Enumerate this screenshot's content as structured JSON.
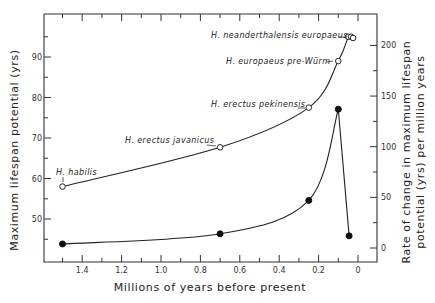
{
  "chart_data": {
    "type": "line",
    "title": "",
    "xlabel": "Millions of years before present",
    "ylabel": "Maximum lifespan potential (yrs)",
    "y2label_line1": "Rate of change in maximum lifespan",
    "y2label_line2": "potential (yrs) per million years",
    "xlim": [
      1.62,
      -0.05
    ],
    "x_reversed": true,
    "ylim": [
      42,
      99
    ],
    "y2lim": [
      -12,
      220
    ],
    "x_ticks": [
      1.4,
      1.2,
      1.0,
      0.8,
      0.6,
      0.4,
      0.2,
      0
    ],
    "x_tick_labels": [
      "1.4",
      "1.2",
      "1.0",
      "0.8",
      "0.6",
      "0.4",
      "0.2",
      "0"
    ],
    "y_ticks": [
      50,
      60,
      70,
      80,
      90
    ],
    "y_tick_labels": [
      "50",
      "60",
      "70",
      "80",
      "90"
    ],
    "y2_ticks": [
      0,
      50,
      100,
      150,
      200
    ],
    "y2_tick_labels": [
      "0",
      "50",
      "100",
      "150",
      "200"
    ],
    "grid": false,
    "series": [
      {
        "name": "Maximum lifespan potential",
        "axis": "left",
        "marker": "open-circle",
        "x": [
          1.5,
          0.7,
          0.25,
          0.1,
          0.05,
          0.035,
          0.025
        ],
        "values": [
          58,
          67.7,
          77.5,
          89,
          95,
          95,
          94.7
        ],
        "labels": [
          "H. habilis",
          "H. erectus javanicus",
          "H. erectus pekinensis",
          "H. europaeus pre-Würm",
          "H. neanderthalensis europaeus",
          "",
          ""
        ]
      },
      {
        "name": "Rate of change in maximum lifespan potential",
        "axis": "right",
        "marker": "filled-circle",
        "x": [
          1.5,
          0.7,
          0.25,
          0.1,
          0.045
        ],
        "values": [
          4,
          14,
          47,
          137,
          12
        ]
      }
    ]
  }
}
